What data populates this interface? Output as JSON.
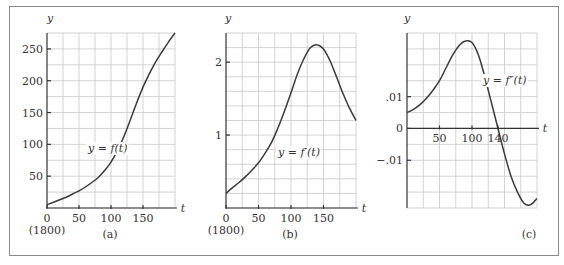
{
  "chart_data": [
    {
      "type": "line",
      "panel_label": "(a)",
      "title": "",
      "curve_label": "y = f(t)",
      "xlabel": "t",
      "ylabel": "y",
      "xlim": [
        0,
        200
      ],
      "ylim": [
        0,
        275
      ],
      "x_ticks": [
        0,
        50,
        100,
        150
      ],
      "x_tick_labels": [
        "0",
        "50",
        "100",
        "150"
      ],
      "x_sub_label": "(1800)",
      "y_ticks": [
        50,
        100,
        150,
        200,
        250
      ],
      "y_tick_labels": [
        "50",
        "100",
        "150",
        "200",
        "250"
      ],
      "grid": true,
      "grid_x_step": 25,
      "grid_y_step": 25,
      "x": [
        0,
        10,
        20,
        30,
        40,
        50,
        60,
        70,
        80,
        90,
        100,
        110,
        120,
        130,
        140,
        150,
        160,
        170,
        180,
        190,
        200
      ],
      "values": [
        5,
        9,
        13,
        17,
        22,
        27,
        33,
        40,
        48,
        59,
        72,
        90,
        112,
        138,
        165,
        190,
        211,
        230,
        246,
        261,
        275
      ]
    },
    {
      "type": "line",
      "panel_label": "(b)",
      "title": "",
      "curve_label": "y = f′(t)",
      "xlabel": "t",
      "ylabel": "y",
      "xlim": [
        0,
        200
      ],
      "ylim": [
        0,
        2.4
      ],
      "x_ticks": [
        0,
        50,
        100,
        150
      ],
      "x_tick_labels": [
        "0",
        "50",
        "100",
        "150"
      ],
      "x_sub_label": "(1800)",
      "y_ticks": [
        1,
        2
      ],
      "y_tick_labels": [
        "1",
        "2"
      ],
      "grid": true,
      "grid_x_step": 25,
      "grid_y_step": 0.2,
      "x": [
        0,
        10,
        20,
        30,
        40,
        50,
        60,
        70,
        80,
        90,
        100,
        110,
        120,
        130,
        140,
        150,
        160,
        170,
        180,
        190,
        200
      ],
      "values": [
        0.2,
        0.28,
        0.35,
        0.43,
        0.52,
        0.62,
        0.75,
        0.9,
        1.1,
        1.33,
        1.58,
        1.84,
        2.05,
        2.2,
        2.24,
        2.18,
        2.02,
        1.8,
        1.57,
        1.37,
        1.2
      ]
    },
    {
      "type": "line",
      "panel_label": "(c)",
      "title": "",
      "curve_label": "y = f″(t)",
      "xlabel": "t",
      "ylabel": "y",
      "xlim": [
        0,
        200
      ],
      "ylim": [
        -0.025,
        0.03
      ],
      "x_ticks": [
        50,
        100,
        140
      ],
      "x_tick_labels": [
        "50",
        "100",
        "140"
      ],
      "y_ticks": [
        0.01,
        0,
        -0.01
      ],
      "y_tick_labels": [
        ".01",
        "0",
        "−.01"
      ],
      "grid": true,
      "grid_x_step": 25,
      "grid_y_step": 0.005,
      "x": [
        0,
        10,
        20,
        30,
        40,
        50,
        60,
        70,
        80,
        90,
        100,
        110,
        120,
        130,
        140,
        150,
        160,
        170,
        180,
        190,
        200
      ],
      "values": [
        0.005,
        0.006,
        0.0075,
        0.0095,
        0.012,
        0.015,
        0.019,
        0.023,
        0.026,
        0.0275,
        0.027,
        0.023,
        0.016,
        0.008,
        0.0,
        -0.008,
        -0.015,
        -0.02,
        -0.0235,
        -0.024,
        -0.022
      ]
    }
  ]
}
